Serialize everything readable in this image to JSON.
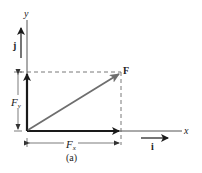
{
  "diagram": {
    "caption": "(a)",
    "axes": {
      "x_label": "x",
      "y_label": "y"
    },
    "vectors": {
      "force": {
        "label": "F",
        "color": "#6e6e6e"
      },
      "fx": {
        "label": "F",
        "sub": "x",
        "color": "#1a1a1a"
      },
      "fy": {
        "label": "F",
        "sub": "y",
        "color": "#1a1a1a"
      },
      "unit_i": {
        "label": "i"
      },
      "unit_j": {
        "label": "j"
      }
    },
    "dimension_labels": {
      "fx_dim": {
        "label": "F",
        "sub": "x"
      },
      "fy_dim": {
        "label": "F",
        "sub": "y"
      }
    }
  }
}
